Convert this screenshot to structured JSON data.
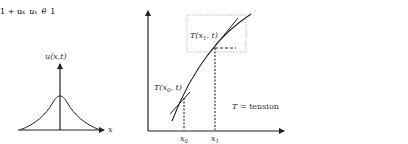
{
  "diagram": {
    "left_plot": {
      "y_label": "u(x,t)",
      "x_label": "x",
      "curve": "bell-shaped profile centered on vertical axis"
    },
    "middle_plot": {
      "tension_upper_label": "T(x1,t)",
      "tension_lower_label": "T(x0,t)",
      "x_ticks": [
        "x0",
        "x1"
      ],
      "legend": "T =  tension"
    },
    "inset": {
      "hypotenuse_label": "√1 + u_x",
      "vertical_label": "u_x",
      "angle_label": "θ",
      "horizontal_label": "1"
    },
    "colors": {
      "stroke": "#222222",
      "dotted": "#999999",
      "text": "#333333"
    }
  }
}
